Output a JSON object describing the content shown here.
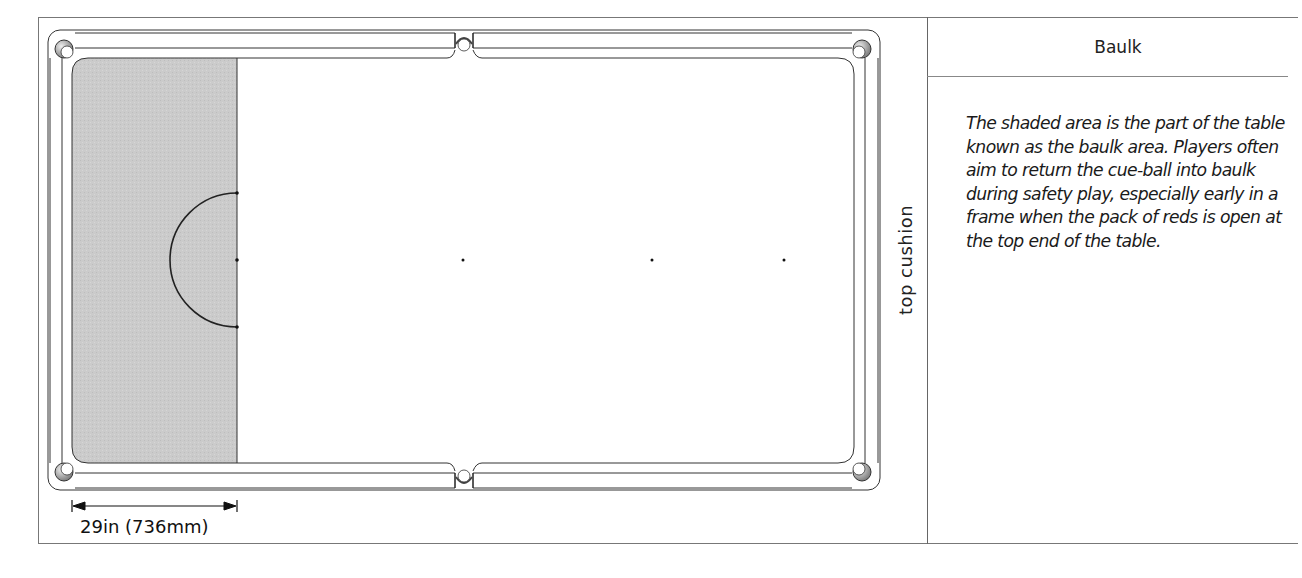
{
  "panel": {
    "title": "Baulk",
    "description": "The shaded area is the part of the table known as the baulk area. Players often aim to return the cue-ball into baulk during safety play, especially early in a frame when the pack of reds is open at the top end of the table."
  },
  "diagram": {
    "side_label": "top cushion",
    "dimension_label": "29in  (736mm)",
    "shaded_region": "baulk area",
    "shade_color": "#c8c8c8",
    "line_color": "#222222",
    "spots": [
      {
        "name": "brown-spot",
        "x": 237,
        "y": 260
      },
      {
        "name": "blue-spot",
        "x": 463,
        "y": 260
      },
      {
        "name": "pink-spot",
        "x": 652,
        "y": 260
      },
      {
        "name": "black-spot",
        "x": 784,
        "y": 260
      }
    ]
  }
}
